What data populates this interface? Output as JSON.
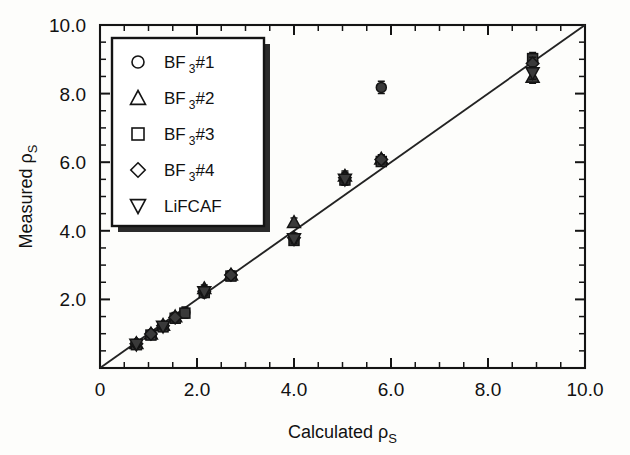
{
  "chart_data": {
    "type": "scatter",
    "title": "",
    "xlabel": "Calculated ρs",
    "ylabel": "Measured ρs",
    "xlabel_main": "Calculated",
    "ylabel_main": "Measured",
    "xlabel_symbol": "ρ",
    "xlabel_subscript": "S",
    "xlim": [
      0,
      10
    ],
    "ylim": [
      0,
      10
    ],
    "xticks": [
      0,
      2.0,
      4.0,
      6.0,
      8.0,
      10.0
    ],
    "yticks": [
      2.0,
      4.0,
      6.0,
      8.0,
      10.0
    ],
    "xtick_labels": [
      "0",
      "2.0",
      "4.0",
      "6.0",
      "8.0",
      "10.0"
    ],
    "ytick_labels": [
      "2.0",
      "4.0",
      "6.0",
      "8.0",
      "10.0"
    ],
    "minor_tick_interval": 0.5,
    "grid": false,
    "legend_position": "upper-left",
    "reference_line": {
      "label": "1:1 line",
      "from": [
        0,
        0
      ],
      "to": [
        10,
        10
      ]
    },
    "series": [
      {
        "name": "BF 3#1",
        "marker": "circle",
        "points": [
          {
            "x": 0.75,
            "y": 0.7,
            "yerr": 0.1
          },
          {
            "x": 1.05,
            "y": 0.98,
            "yerr": 0.1
          },
          {
            "x": 1.3,
            "y": 1.22,
            "yerr": 0.1
          },
          {
            "x": 1.55,
            "y": 1.48,
            "yerr": 0.14
          },
          {
            "x": 1.75,
            "y": 1.62,
            "yerr": 0.16
          },
          {
            "x": 2.15,
            "y": 2.18,
            "yerr": 0.12
          },
          {
            "x": 2.7,
            "y": 2.7,
            "yerr": 0.12
          },
          {
            "x": 4.0,
            "y": 3.78,
            "yerr": 0.14
          },
          {
            "x": 5.05,
            "y": 5.52,
            "yerr": 0.16
          },
          {
            "x": 5.8,
            "y": 6.05,
            "yerr": 0.14
          },
          {
            "x": 5.8,
            "y": 8.18,
            "yerr": 0.18
          },
          {
            "x": 8.92,
            "y": 8.95,
            "yerr": 0.2
          }
        ]
      },
      {
        "name": "BF 3#2",
        "marker": "triangle-up",
        "points": [
          {
            "x": 0.75,
            "y": 0.72,
            "yerr": 0.08
          },
          {
            "x": 1.05,
            "y": 1.0,
            "yerr": 0.08
          },
          {
            "x": 1.3,
            "y": 1.25,
            "yerr": 0.08
          },
          {
            "x": 1.55,
            "y": 1.5,
            "yerr": 0.1
          },
          {
            "x": 2.15,
            "y": 2.32,
            "yerr": 0.1
          },
          {
            "x": 2.7,
            "y": 2.72,
            "yerr": 0.1
          },
          {
            "x": 4.0,
            "y": 4.25,
            "yerr": 0.12
          },
          {
            "x": 5.05,
            "y": 5.6,
            "yerr": 0.14
          },
          {
            "x": 5.8,
            "y": 6.1,
            "yerr": 0.12
          },
          {
            "x": 8.92,
            "y": 8.48,
            "yerr": 0.18
          }
        ]
      },
      {
        "name": "BF 3#3",
        "marker": "square",
        "points": [
          {
            "x": 0.75,
            "y": 0.68,
            "yerr": 0.09
          },
          {
            "x": 1.05,
            "y": 0.96,
            "yerr": 0.09
          },
          {
            "x": 1.3,
            "y": 1.2,
            "yerr": 0.09
          },
          {
            "x": 1.55,
            "y": 1.45,
            "yerr": 0.12
          },
          {
            "x": 1.75,
            "y": 1.6,
            "yerr": 0.14
          },
          {
            "x": 2.15,
            "y": 2.2,
            "yerr": 0.11
          },
          {
            "x": 2.7,
            "y": 2.68,
            "yerr": 0.11
          },
          {
            "x": 4.0,
            "y": 3.72,
            "yerr": 0.13
          },
          {
            "x": 5.05,
            "y": 5.48,
            "yerr": 0.15
          },
          {
            "x": 5.8,
            "y": 6.02,
            "yerr": 0.13
          },
          {
            "x": 8.92,
            "y": 9.02,
            "yerr": 0.18
          }
        ]
      },
      {
        "name": "BF 3#4",
        "marker": "diamond",
        "points": [
          {
            "x": 0.75,
            "y": 0.71,
            "yerr": 0.09
          },
          {
            "x": 1.05,
            "y": 0.99,
            "yerr": 0.09
          },
          {
            "x": 1.3,
            "y": 1.23,
            "yerr": 0.09
          },
          {
            "x": 1.55,
            "y": 1.47,
            "yerr": 0.12
          },
          {
            "x": 2.15,
            "y": 2.24,
            "yerr": 0.11
          },
          {
            "x": 2.7,
            "y": 2.71,
            "yerr": 0.11
          },
          {
            "x": 4.0,
            "y": 3.8,
            "yerr": 0.13
          },
          {
            "x": 5.05,
            "y": 5.55,
            "yerr": 0.15
          },
          {
            "x": 5.8,
            "y": 6.08,
            "yerr": 0.13
          },
          {
            "x": 8.92,
            "y": 8.88,
            "yerr": 0.18
          }
        ]
      },
      {
        "name": "LiFCAF",
        "marker": "triangle-down",
        "points": [
          {
            "x": 0.75,
            "y": 0.69,
            "yerr": 0.09
          },
          {
            "x": 1.3,
            "y": 1.21,
            "yerr": 0.09
          },
          {
            "x": 2.15,
            "y": 2.22,
            "yerr": 0.11
          },
          {
            "x": 4.0,
            "y": 3.76,
            "yerr": 0.13
          },
          {
            "x": 5.05,
            "y": 5.5,
            "yerr": 0.15
          },
          {
            "x": 8.92,
            "y": 8.6,
            "yerr": 0.18
          }
        ]
      }
    ]
  },
  "legend": {
    "items": [
      {
        "marker": "circle",
        "label_main": "BF",
        "label_sub": "3",
        "label_tail": "#1",
        "full": "BF 3#1"
      },
      {
        "marker": "triangle-up",
        "label_main": "BF",
        "label_sub": "3",
        "label_tail": "#2",
        "full": "BF 3#2"
      },
      {
        "marker": "square",
        "label_main": "BF",
        "label_sub": "3",
        "label_tail": "#3",
        "full": "BF 3#3"
      },
      {
        "marker": "diamond",
        "label_main": "BF",
        "label_sub": "3",
        "label_tail": "#4",
        "full": "BF 3#4"
      },
      {
        "marker": "triangle-down",
        "label_main": "LiFCAF",
        "label_sub": "",
        "label_tail": "",
        "full": "LiFCAF"
      }
    ]
  },
  "colors": {
    "ink": "#141414",
    "marker_fill": "#3a3a3a",
    "paper": "#fdfdfb",
    "line": "#232323"
  }
}
